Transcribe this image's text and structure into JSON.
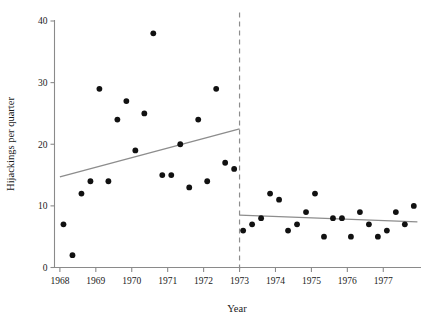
{
  "figure": {
    "background_color": "#ffffff",
    "point_color": "#111111",
    "line_color": "#8d8d8d",
    "axis_color": "#8a8a8a"
  },
  "chart_data": {
    "type": "scatter",
    "title": "",
    "subtitle": "",
    "xlabel": "Year",
    "ylabel": "Hijackings per quarter",
    "xlim": [
      1967.85,
      1978.05
    ],
    "ylim": [
      0,
      41
    ],
    "grid": false,
    "legend": null,
    "x_ticks": [
      1968,
      1969,
      1970,
      1971,
      1972,
      1973,
      1974,
      1975,
      1976,
      1977
    ],
    "x_tick_labels": [
      "1968",
      "1969",
      "1970",
      "1971",
      "1972",
      "1973",
      "1974",
      "1975",
      "1976",
      "1977"
    ],
    "y_ticks": [
      0,
      10,
      20,
      30,
      40
    ],
    "y_tick_labels": [
      "0",
      "10",
      "20",
      "30",
      "40"
    ],
    "annotations": [
      {
        "name": "policy-cutoff",
        "type": "vertical-dashed-line",
        "x": 1973.0,
        "style": "dashed"
      }
    ],
    "series": [
      {
        "name": "Hijackings per quarter",
        "marker": "filled-circle",
        "x": [
          1968.1,
          1968.35,
          1968.6,
          1968.85,
          1969.1,
          1969.35,
          1969.6,
          1969.85,
          1970.1,
          1970.35,
          1970.6,
          1970.85,
          1971.1,
          1971.35,
          1971.6,
          1971.85,
          1972.1,
          1972.35,
          1972.6,
          1972.85,
          1973.1,
          1973.35,
          1973.6,
          1973.85,
          1974.1,
          1974.35,
          1974.6,
          1974.85,
          1975.1,
          1975.35,
          1975.6,
          1975.85,
          1976.1,
          1976.35,
          1976.6,
          1976.85,
          1977.1,
          1977.35,
          1977.6,
          1977.85
        ],
        "y": [
          7,
          2,
          12,
          14,
          29,
          14,
          24,
          27,
          19,
          25,
          38,
          15,
          15,
          20,
          13,
          24,
          14,
          29,
          17,
          16,
          6,
          7,
          8,
          12,
          11,
          6,
          7,
          9,
          12,
          5,
          8,
          8,
          5,
          9,
          7,
          5,
          6,
          9,
          7,
          10
        ]
      }
    ],
    "fit_lines": [
      {
        "name": "pre-intervention-trend",
        "segment": "before-1973",
        "x_start": 1968.0,
        "y_start": 14.7,
        "x_end": 1973.0,
        "y_end": 22.5
      },
      {
        "name": "post-intervention-trend",
        "segment": "after-1973",
        "x_start": 1973.0,
        "y_start": 8.5,
        "x_end": 1977.95,
        "y_end": 7.4
      }
    ]
  }
}
